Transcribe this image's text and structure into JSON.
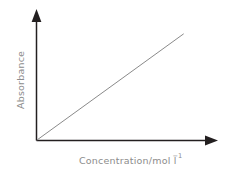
{
  "figure": {
    "background_color": "#ffffff",
    "width": 234,
    "height": 175
  },
  "axes": {
    "x_label_main": "Concentration/mol l",
    "x_label_superscript": "−1",
    "y_label": "Absorbance",
    "label_color": "#8c8c8c",
    "axis_color": "#231f20",
    "x_arrow_name": "x-axis-arrowhead",
    "y_arrow_name": "y-axis-arrowhead"
  },
  "chart_data": {
    "type": "line",
    "title": "",
    "subtitle": "",
    "xlabel": "Concentration/mol l−1",
    "ylabel": "Absorbance",
    "xlim": [
      0,
      1
    ],
    "ylim": [
      0,
      1
    ],
    "grid": false,
    "legend": false,
    "legend_position": "none",
    "x_ticks": [],
    "y_ticks": [],
    "x_tick_labels": [],
    "y_tick_labels": [],
    "annotations": [],
    "series": [
      {
        "name": "Beer-Lambert linear calibration",
        "color": "#8a8a8a",
        "x": [
          0.0,
          0.1,
          0.2,
          0.3,
          0.4,
          0.5,
          0.6,
          0.7,
          0.8,
          0.9
        ],
        "y": [
          0.0,
          0.1,
          0.2,
          0.3,
          0.4,
          0.5,
          0.6,
          0.7,
          0.8,
          0.9
        ],
        "slope": 1.0,
        "intercept": 0.0
      }
    ]
  }
}
